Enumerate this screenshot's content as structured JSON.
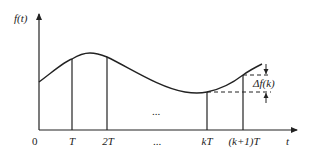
{
  "diagram": {
    "y_axis_label": "f(t)",
    "x_axis_label": "t",
    "origin_label": "0",
    "tick_labels": [
      "T",
      "2T",
      "kT",
      "(k+1)T"
    ],
    "ellipsis_label": "...",
    "ellipsis_mid_label": "...",
    "delta_label": "Δf(k)",
    "colors": {
      "line": "#222222",
      "background": "#ffffff"
    }
  }
}
